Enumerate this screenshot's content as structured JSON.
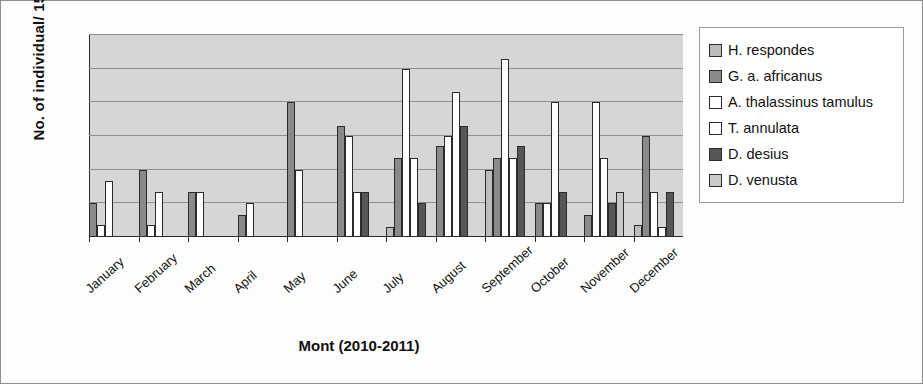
{
  "chart_data": {
    "type": "bar",
    "title": "",
    "xlabel": "Mont (2010-2011)",
    "ylabel": "No. of individual/ 15m²",
    "ylim": [
      0,
      6
    ],
    "yticks": [
      0,
      1,
      2,
      3,
      4,
      5,
      6
    ],
    "grid": true,
    "legend_position": "right",
    "categories": [
      "January",
      "February",
      "March",
      "April",
      "May",
      "June",
      "July",
      "August",
      "September",
      "October",
      "November",
      "December"
    ],
    "series": [
      {
        "name": "H. respondes",
        "color": "#bcbcbc",
        "values": [
          0,
          0,
          0,
          0,
          0,
          0,
          0.3,
          0,
          2.0,
          0,
          0,
          0.35
        ]
      },
      {
        "name": "G. a. africanus",
        "color": "#8a8a8a",
        "values": [
          1.0,
          2.0,
          1.35,
          0.65,
          4.0,
          3.3,
          2.35,
          2.7,
          2.35,
          1.0,
          0.65,
          3.0
        ]
      },
      {
        "name": "A. thalassinus tamulus",
        "color": "#ffffff",
        "values": [
          0.35,
          0.35,
          0,
          0,
          0,
          3.0,
          5.0,
          3.0,
          5.3,
          1.0,
          4.0,
          1.35
        ]
      },
      {
        "name": "T. annulata",
        "color": "#ffffff",
        "values": [
          1.65,
          1.35,
          1.35,
          1.0,
          2.0,
          1.35,
          2.35,
          4.3,
          2.35,
          4.0,
          2.35,
          0.3
        ]
      },
      {
        "name": "D. desius",
        "color": "#565656",
        "values": [
          0,
          0,
          0,
          0,
          0,
          1.35,
          1.0,
          3.3,
          2.7,
          1.35,
          1.0,
          1.35
        ]
      },
      {
        "name": "D. venusta",
        "color": "#c9c9c9",
        "values": [
          0,
          0,
          0,
          0,
          0,
          0,
          0,
          0,
          0,
          0,
          1.35,
          0
        ]
      }
    ]
  },
  "axis": {
    "y_title": "No. of individual/ 15m",
    "y_title_sup": "2",
    "x_title": "Mont (2010-2011)"
  }
}
